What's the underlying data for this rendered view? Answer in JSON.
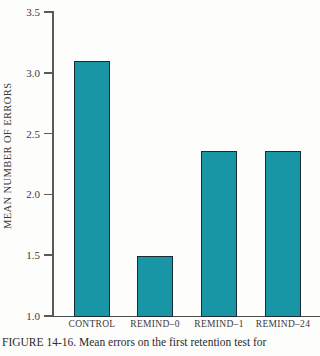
{
  "chart_data": {
    "type": "bar",
    "categories": [
      "CONTROL",
      "REMIND–0",
      "REMIND–1",
      "REMIND–24"
    ],
    "values": [
      3.1,
      1.49,
      2.36,
      2.36
    ],
    "title": "",
    "xlabel": "",
    "ylabel": "MEAN NUMBER OF ERRORS",
    "ylim": [
      1.0,
      3.5
    ],
    "yticks": [
      1.0,
      1.5,
      2.0,
      2.5,
      3.0,
      3.5
    ],
    "ytick_labels": [
      "1.0",
      "1.5",
      "2.0",
      "2.5",
      "3.0",
      "3.5"
    ],
    "grid": false,
    "legend_position": "none",
    "bar_color": "#1896a6",
    "bar_border_color": "#1b2a33",
    "axis_color": "#595959"
  },
  "caption": "FIGURE 14-16. Mean errors on the first retention test for"
}
